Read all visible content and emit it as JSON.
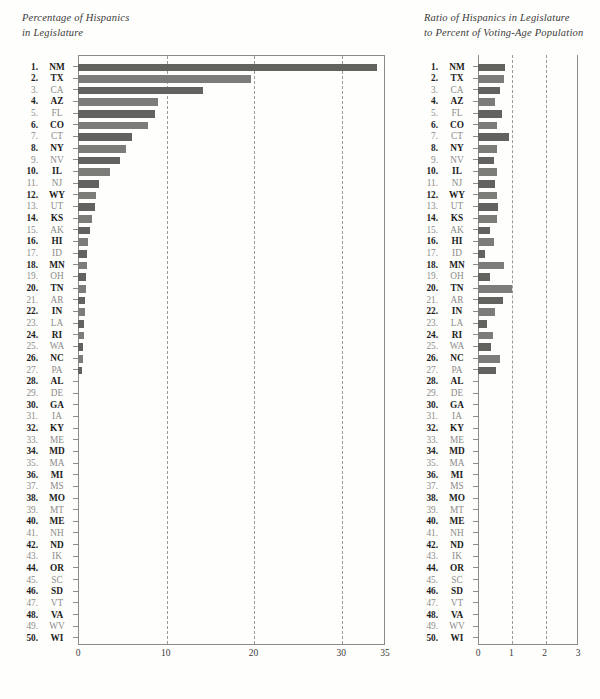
{
  "chart_data": [
    {
      "id": "left",
      "type": "bar",
      "orientation": "horizontal",
      "title": "Percentage of Hispanics\nin Legislature",
      "xlabel": "",
      "ylabel": "",
      "xlim": [
        0,
        35
      ],
      "ticks": [
        0,
        10,
        20,
        30,
        35
      ],
      "gridlines": [
        10,
        20,
        30
      ],
      "grid": "dashed-vertical",
      "legend": "none",
      "categories": [
        "NM",
        "TX",
        "CA",
        "AZ",
        "FL",
        "CO",
        "CT",
        "NY",
        "NV",
        "IL",
        "NJ",
        "WY",
        "UT",
        "KS",
        "AK",
        "HI",
        "ID",
        "MN",
        "OH",
        "TN",
        "AR",
        "IN",
        "LA",
        "RI",
        "WA",
        "NC",
        "PA",
        "AL",
        "DE",
        "GA",
        "IA",
        "KY",
        "ME",
        "MD",
        "MA",
        "MI",
        "MS",
        "MO",
        "MT",
        "ME",
        "NH",
        "ND",
        "IK",
        "OR",
        "SC",
        "SD",
        "VT",
        "VA",
        "WV",
        "WI"
      ],
      "values": [
        34.1,
        19.7,
        14.2,
        9.1,
        8.8,
        8.0,
        6.1,
        5.5,
        4.8,
        3.6,
        2.4,
        2.0,
        1.9,
        1.6,
        1.4,
        1.1,
        1.0,
        1.0,
        0.9,
        0.9,
        0.8,
        0.8,
        0.7,
        0.7,
        0.6,
        0.6,
        0.5,
        0,
        0,
        0,
        0,
        0,
        0,
        0,
        0,
        0,
        0,
        0,
        0,
        0,
        0,
        0,
        0,
        0,
        0,
        0,
        0,
        0,
        0,
        0
      ]
    },
    {
      "id": "right",
      "type": "bar",
      "orientation": "horizontal",
      "title": "Ratio of Hispanics in Legislature\nto Percent of Voting-Age Population",
      "xlabel": "",
      "ylabel": "",
      "xlim": [
        0,
        3
      ],
      "ticks": [
        0,
        1,
        2,
        3
      ],
      "gridlines": [
        1,
        2
      ],
      "grid": "dashed-vertical",
      "legend": "none",
      "categories": [
        "NM",
        "TX",
        "CA",
        "AZ",
        "FL",
        "CO",
        "CT",
        "NY",
        "NV",
        "IL",
        "NJ",
        "WY",
        "UT",
        "KS",
        "AK",
        "HI",
        "ID",
        "MN",
        "OH",
        "TN",
        "AR",
        "IN",
        "LA",
        "RI",
        "WA",
        "NC",
        "PA",
        "AL",
        "DE",
        "GA",
        "IA",
        "KY",
        "ME",
        "MD",
        "MA",
        "MI",
        "MS",
        "MO",
        "MT",
        "ME",
        "NH",
        "ND",
        "IK",
        "OR",
        "SC",
        "SD",
        "VT",
        "VA",
        "WV",
        "WI"
      ],
      "values": [
        0.8,
        0.77,
        0.67,
        0.52,
        0.72,
        0.56,
        0.92,
        0.56,
        0.48,
        0.58,
        0.5,
        0.56,
        0.61,
        0.58,
        0.36,
        0.49,
        0.22,
        0.78,
        0.37,
        1.03,
        0.75,
        0.52,
        0.28,
        0.44,
        0.38,
        0.66,
        0.55,
        0,
        0,
        0,
        0,
        0,
        0,
        0,
        0,
        0,
        0,
        0,
        0,
        0,
        0,
        0,
        0,
        0,
        0,
        0,
        0,
        0,
        0,
        0
      ]
    }
  ],
  "ranks": [
    1,
    2,
    3,
    4,
    5,
    6,
    7,
    8,
    9,
    10,
    11,
    12,
    13,
    14,
    15,
    16,
    17,
    18,
    19,
    20,
    21,
    22,
    23,
    24,
    25,
    26,
    27,
    28,
    29,
    30,
    31,
    32,
    33,
    34,
    35,
    36,
    37,
    38,
    39,
    40,
    41,
    42,
    43,
    44,
    45,
    46,
    47,
    48,
    49,
    50
  ],
  "emphasis": [
    "strong",
    "strong",
    "faint",
    "strong",
    "faint",
    "strong",
    "faint",
    "strong",
    "faint",
    "strong",
    "faint",
    "strong",
    "faint",
    "strong",
    "faint",
    "strong",
    "faint",
    "strong",
    "faint",
    "strong",
    "faint",
    "strong",
    "faint",
    "strong",
    "faint",
    "strong",
    "faint",
    "strong",
    "faint",
    "strong",
    "faint",
    "strong",
    "faint",
    "strong",
    "faint",
    "strong",
    "faint",
    "strong",
    "faint",
    "strong",
    "faint",
    "strong",
    "faint",
    "strong",
    "faint",
    "strong",
    "faint",
    "strong",
    "faint",
    "strong"
  ],
  "style": {
    "bar_color": "#6f6f6c",
    "axis_color": "#8b8b88",
    "grid_color": "#9a9a97",
    "text_color": "#2b2b2b",
    "faint_text_color": "#8c8c88",
    "background": "#fefefd"
  }
}
